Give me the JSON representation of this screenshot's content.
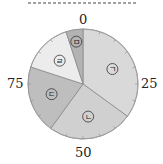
{
  "chart_data": {
    "type": "pie",
    "title": "",
    "start_angle": "top (0 at 12 o'clock), clockwise",
    "scale_max": 100,
    "scale_labels": [
      {
        "value": 0,
        "label": "0"
      },
      {
        "value": 25,
        "label": "25"
      },
      {
        "value": 50,
        "label": "50"
      },
      {
        "value": 75,
        "label": "75"
      }
    ],
    "categories": [
      "ㄱ",
      "ㄴ",
      "ㄷ",
      "ㄹ",
      "ㅁ"
    ],
    "values": [
      35,
      25,
      20,
      15,
      5
    ],
    "ranges": [
      [
        0,
        35
      ],
      [
        35,
        60
      ],
      [
        60,
        80
      ],
      [
        80,
        95
      ],
      [
        95,
        100
      ]
    ],
    "colors": [
      "#d9d9d9",
      "#d0d0d0",
      "#bebebe",
      "#ececec",
      "#b3b3b3"
    ],
    "minor_ticks_every": 5
  },
  "labels": {
    "tick_0": "0",
    "tick_25": "25",
    "tick_50": "50",
    "tick_75": "75"
  }
}
